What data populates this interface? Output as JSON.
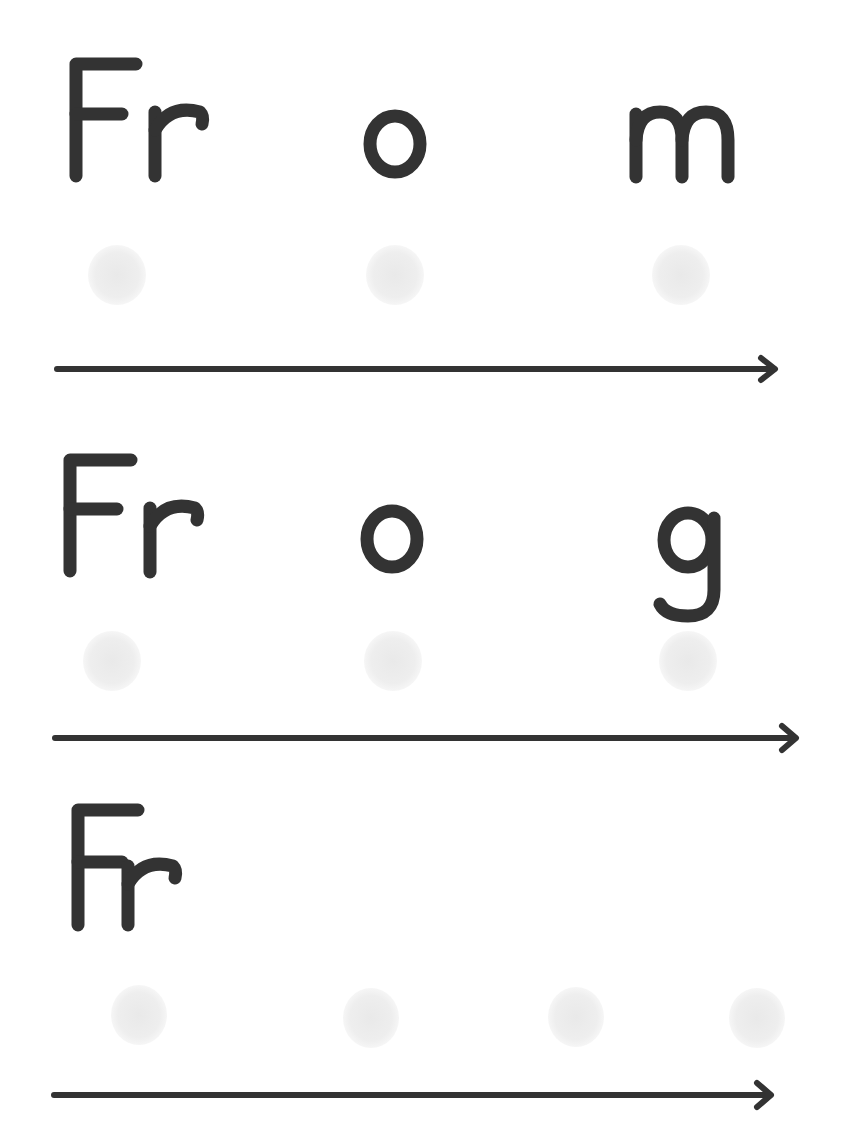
{
  "worksheet": {
    "type": "word blending practice",
    "colors": {
      "ink": "#333333",
      "dot": "#ececec",
      "background": "#ffffff"
    },
    "rows": [
      {
        "word": "From",
        "units": [
          "Fr",
          "o",
          "m"
        ],
        "dots": 3,
        "arrow": "right-arrow"
      },
      {
        "word": "Frog",
        "units": [
          "Fr",
          "o",
          "g"
        ],
        "dots": 3,
        "arrow": "right-arrow"
      },
      {
        "word": "Front",
        "units": [
          "Fr",
          "o",
          "n",
          "t"
        ],
        "dots": 4,
        "arrow": "right-arrow"
      }
    ]
  }
}
